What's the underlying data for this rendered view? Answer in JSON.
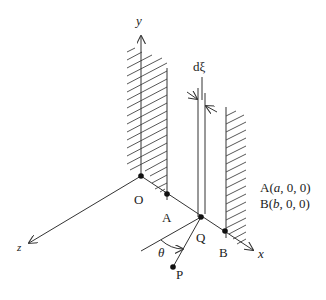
{
  "diagram": {
    "type": "3D coordinate geometry figure",
    "axes": {
      "x": "x",
      "y": "y",
      "z": "z"
    },
    "points": {
      "origin": "O",
      "a": "A",
      "q": "Q",
      "b": "B",
      "p": "P"
    },
    "strip_width_label": "dξ",
    "angle_label": "θ",
    "coordinates": {
      "a_line_prefix": "A(",
      "a_line_var": "a",
      "a_line_suffix": ", 0, 0)",
      "b_line_prefix": "B(",
      "b_line_var": "b",
      "b_line_suffix": ", 0, 0)"
    },
    "colors": {
      "line": "#333333",
      "background": "#ffffff"
    }
  }
}
